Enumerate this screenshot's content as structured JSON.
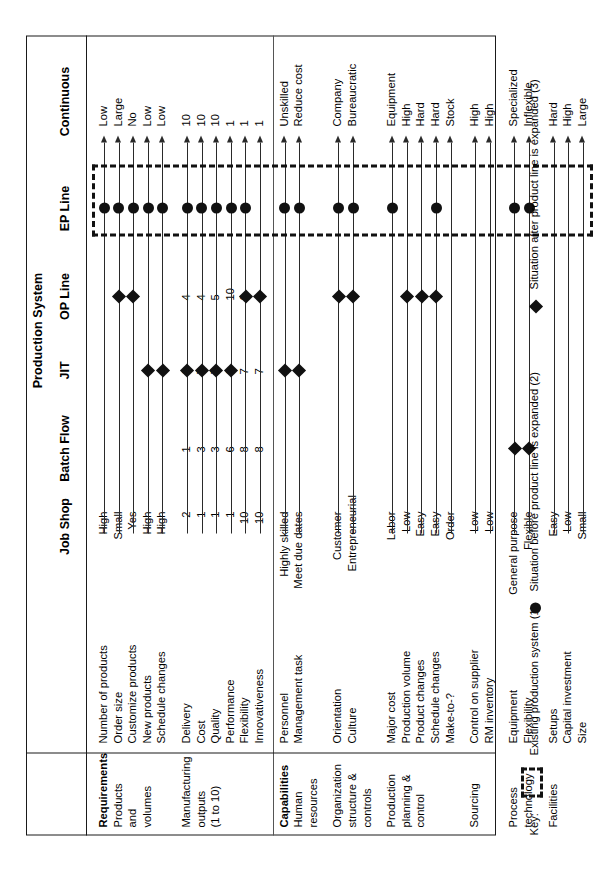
{
  "figure": {
    "group_header": "Production System",
    "columns": [
      "Job Shop",
      "Batch Flow",
      "JIT",
      "OP Line",
      "EP Line",
      "Continuous"
    ],
    "sections": [
      {
        "title": "Requirements",
        "subtitle_lines": [
          "Products",
          "and",
          "volumes"
        ],
        "rows": [
          {
            "label": "Number of products",
            "left": "High",
            "right": "Low",
            "mid": "",
            "markers": [
              {
                "type": "circle",
                "col": "EP Line"
              }
            ]
          },
          {
            "label": "Order size",
            "left": "Small",
            "right": "Large",
            "mid": "",
            "markers": [
              {
                "type": "diamond",
                "col": "OP Line"
              },
              {
                "type": "circle",
                "col": "EP Line"
              }
            ]
          },
          {
            "label": "Customize products",
            "left": "Yes",
            "right": "No",
            "mid": "",
            "markers": [
              {
                "type": "diamond",
                "col": "OP Line"
              },
              {
                "type": "circle",
                "col": "EP Line"
              }
            ]
          },
          {
            "label": "New products",
            "left": "High",
            "right": "Low",
            "mid": "",
            "markers": [
              {
                "type": "diamond",
                "col": "JIT"
              },
              {
                "type": "circle",
                "col": "EP Line"
              }
            ]
          },
          {
            "label": "Schedule changes",
            "left": "High",
            "right": "Low",
            "mid": "",
            "markers": [
              {
                "type": "diamond",
                "col": "JIT"
              },
              {
                "type": "circle",
                "col": "EP Line"
              }
            ]
          }
        ]
      },
      {
        "title": "",
        "subtitle_lines": [
          "Manufacturing",
          "outputs",
          "(1 to 10)"
        ],
        "rows": [
          {
            "label": "Delivery",
            "left": "2",
            "right": "10",
            "mid_left": "1",
            "mid_jit": "6",
            "mid_op": "4",
            "markers": [
              {
                "type": "diamond",
                "col": "JIT"
              },
              {
                "type": "circle",
                "col": "EP Line"
              }
            ]
          },
          {
            "label": "Cost",
            "left": "1",
            "right": "10",
            "mid_left": "3",
            "mid_jit": "7",
            "mid_op": "4",
            "markers": [
              {
                "type": "diamond",
                "col": "JIT"
              },
              {
                "type": "circle",
                "col": "EP Line"
              }
            ]
          },
          {
            "label": "Quality",
            "left": "1",
            "right": "10",
            "mid_left": "3",
            "mid_jit": "7",
            "mid_op": "5",
            "markers": [
              {
                "type": "diamond",
                "col": "JIT"
              },
              {
                "type": "circle",
                "col": "EP Line"
              }
            ]
          },
          {
            "label": "Performance",
            "left": "1",
            "right": "1",
            "mid_left": "6",
            "mid_jit": "6",
            "mid_op": "10",
            "markers": [
              {
                "type": "diamond",
                "col": "JIT"
              },
              {
                "type": "circle",
                "col": "EP Line"
              }
            ]
          },
          {
            "label": "Flexibility",
            "left": "10",
            "right": "1",
            "mid_left": "8",
            "mid_jit": "7",
            "mid_op": "6",
            "markers": [
              {
                "type": "diamond",
                "col": "OP Line"
              },
              {
                "type": "circle",
                "col": "EP Line"
              }
            ]
          },
          {
            "label": "Innovativeness",
            "left": "10",
            "right": "1",
            "mid_left": "8",
            "mid_jit": "7",
            "mid_op": "4",
            "markers": [
              {
                "type": "diamond",
                "col": "OP Line"
              }
            ]
          }
        ]
      },
      {
        "title": "Capabilities",
        "subtitle_lines": [
          "Human",
          "resources"
        ],
        "rows": [
          {
            "label": "Personnel",
            "left": "Highly skilled",
            "right": "Unskilled",
            "markers": [
              {
                "type": "diamond",
                "col": "JIT"
              },
              {
                "type": "circle",
                "col": "EP Line"
              }
            ]
          },
          {
            "label": "Management task",
            "left": "Meet due dates",
            "right": "Reduce cost",
            "markers": [
              {
                "type": "diamond",
                "col": "JIT"
              },
              {
                "type": "circle",
                "col": "EP Line"
              }
            ]
          }
        ]
      },
      {
        "title": "",
        "subtitle_lines": [
          "Organization",
          "structure &",
          "controls"
        ],
        "rows": [
          {
            "label": "Orientation",
            "left": "Customer",
            "right": "Company",
            "markers": [
              {
                "type": "diamond",
                "col": "OP Line"
              },
              {
                "type": "circle",
                "col": "EP Line"
              }
            ]
          },
          {
            "label": "Culture",
            "left": "Entrepreneurial",
            "right": "Bureaucratic",
            "markers": [
              {
                "type": "diamond",
                "col": "OP Line"
              },
              {
                "type": "circle",
                "col": "EP Line"
              }
            ]
          }
        ]
      },
      {
        "title": "",
        "subtitle_lines": [
          "Production",
          "planning &",
          "control"
        ],
        "rows": [
          {
            "label": "Major cost",
            "left": "Labor",
            "right": "Equipment",
            "markers": [
              {
                "type": "circle",
                "col": "EP Line"
              }
            ]
          },
          {
            "label": "Production volume",
            "left": "Low",
            "right": "High",
            "markers": [
              {
                "type": "diamond",
                "col": "OP Line"
              }
            ]
          },
          {
            "label": "Product changes",
            "left": "Easy",
            "right": "Hard",
            "markers": [
              {
                "type": "diamond",
                "col": "OP Line"
              }
            ]
          },
          {
            "label": "Schedule changes",
            "left": "Easy",
            "right": "Hard",
            "markers": [
              {
                "type": "diamond",
                "col": "OP Line"
              },
              {
                "type": "circle",
                "col": "EP Line"
              }
            ]
          },
          {
            "label": "Make-to-?",
            "left": "Order",
            "right": "Stock",
            "markers": []
          }
        ]
      },
      {
        "title": "",
        "subtitle_lines": [
          "Sourcing"
        ],
        "rows": [
          {
            "label": "Control on supplier",
            "left": "Low",
            "right": "High",
            "markers": []
          },
          {
            "label": "RM inventory",
            "left": "Low",
            "right": "High",
            "markers": []
          }
        ]
      },
      {
        "title": "",
        "subtitle_lines": [
          "Process",
          "technology"
        ],
        "rows": [
          {
            "label": "Equipment",
            "left": "General purpose",
            "right": "Specialized",
            "markers": [
              {
                "type": "diamond",
                "col": "Batch Flow"
              },
              {
                "type": "circle",
                "col": "EP Line"
              }
            ]
          },
          {
            "label": "Flexibility",
            "left": "Flexible",
            "right": "Inflexible",
            "markers": [
              {
                "type": "diamond",
                "col": "Batch Flow"
              },
              {
                "type": "circle",
                "col": "EP Line"
              }
            ]
          }
        ]
      },
      {
        "title": "",
        "subtitle_lines": [
          "Facilities"
        ],
        "rows": [
          {
            "label": "Setups",
            "left": "Easy",
            "right": "Hard",
            "markers": []
          },
          {
            "label": "Capital investment",
            "left": "Low",
            "right": "High",
            "markers": []
          },
          {
            "label": "Size",
            "left": "Small",
            "right": "Large",
            "markers": []
          }
        ]
      }
    ]
  },
  "key": {
    "label": "Key:",
    "items": [
      {
        "glyph": "dashed-box",
        "text": "Existing production system (1)"
      },
      {
        "glyph": "circle",
        "text": "Situation before product line is expanded (2)"
      },
      {
        "glyph": "diamond",
        "text": "Situation after product line is expanded (3)"
      }
    ]
  },
  "colors": {
    "ink": "#111111",
    "rule": "#1a1a1a"
  }
}
